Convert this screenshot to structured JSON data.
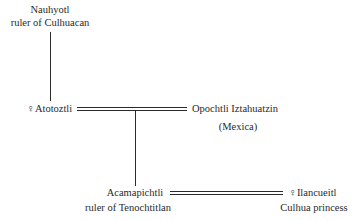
{
  "diagram": {
    "type": "genealogy",
    "nodes": {
      "nauhyotl": {
        "name": "Nauhyotl",
        "title": "ruler of Culhuacan"
      },
      "atotoztli": {
        "symbol": "♀",
        "name": "Atotoztli"
      },
      "opochtli": {
        "name": "Opochtli Iztahuatzin",
        "title": "(Mexica)"
      },
      "acamapichtli": {
        "name": "Acamapichtli",
        "title": "ruler of Tenochtitlan"
      },
      "ilancueitl": {
        "symbol": "♀",
        "name": "Ilancueitl",
        "title": "Culhua princess"
      }
    },
    "edges": [
      {
        "from": "Nauhyotl",
        "to": "Atotoztli",
        "type": "parent-child"
      },
      {
        "from": "Atotoztli",
        "to": "Opochtli Iztahuatzin",
        "type": "marriage"
      },
      {
        "from": "Atotoztli + Opochtli Iztahuatzin",
        "to": "Acamapichtli",
        "type": "parent-child"
      },
      {
        "from": "Acamapichtli",
        "to": "Ilancueitl",
        "type": "marriage"
      }
    ],
    "colors": {
      "ink": "#2a2a2a",
      "background": "#ffffff"
    }
  }
}
